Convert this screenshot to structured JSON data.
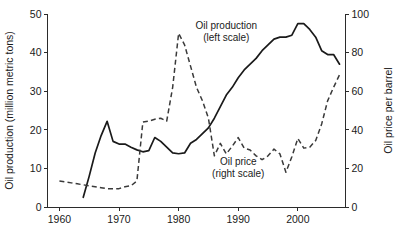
{
  "chart_data": {
    "type": "line",
    "title": "",
    "xlabel": "",
    "xlim": [
      1958,
      2008
    ],
    "grid": false,
    "legend_position": "inline-annotations",
    "x_ticks": [
      1960,
      1970,
      1980,
      1990,
      2000
    ],
    "x_tick_labels": [
      "1960",
      "1970",
      "1980",
      "1990",
      "2000"
    ],
    "axes": [
      {
        "id": "left",
        "label": "Oil production (million metric tons)",
        "ylim": [
          0,
          50
        ],
        "ticks": [
          0,
          10,
          20,
          30,
          40,
          50
        ],
        "tick_labels": [
          "0",
          "10",
          "20",
          "30",
          "40",
          "50"
        ]
      },
      {
        "id": "right",
        "label": "Oil price per barrel",
        "ylim": [
          0,
          100
        ],
        "ticks": [
          0,
          20,
          40,
          60,
          80,
          100
        ],
        "tick_labels": [
          "0",
          "20",
          "40",
          "60",
          "80",
          "100"
        ]
      }
    ],
    "series": [
      {
        "name": "Oil production",
        "annotation": "Oil production\n(left scale)",
        "annotation_line1": "Oil production",
        "annotation_line2": "(left scale)",
        "axis": "left",
        "style": "solid",
        "color": "#1a1a1a",
        "unit": "million metric tons",
        "x": [
          1964,
          1965,
          1966,
          1967,
          1968,
          1969,
          1970,
          1971,
          1972,
          1973,
          1974,
          1975,
          1976,
          1977,
          1978,
          1979,
          1980,
          1981,
          1982,
          1983,
          1984,
          1985,
          1986,
          1987,
          1988,
          1989,
          1990,
          1991,
          1992,
          1993,
          1994,
          1995,
          1996,
          1997,
          1998,
          1999,
          2000,
          2001,
          2002,
          2003,
          2004,
          2005,
          2006,
          2007
        ],
        "y": [
          2.5,
          8.0,
          14.0,
          18.5,
          22.2,
          17.0,
          16.3,
          16.3,
          15.5,
          14.8,
          14.3,
          14.6,
          18.0,
          17.0,
          15.5,
          14.0,
          13.8,
          14.0,
          16.5,
          17.5,
          19.0,
          20.5,
          23.0,
          26.0,
          29.0,
          31.0,
          33.5,
          35.5,
          37.0,
          38.5,
          40.5,
          42.0,
          43.5,
          44.0,
          44.0,
          44.5,
          47.5,
          47.5,
          46.0,
          44.0,
          40.5,
          39.5,
          39.5,
          37.0
        ]
      },
      {
        "name": "Oil price",
        "annotation": "Oil price\n(right scale)",
        "annotation_line1": "Oil price",
        "annotation_line2": "(right scale)",
        "axis": "right",
        "style": "dashed",
        "color": "#3a3a3a",
        "unit": "price per barrel",
        "x": [
          1960,
          1961,
          1962,
          1963,
          1964,
          1965,
          1966,
          1967,
          1968,
          1969,
          1970,
          1971,
          1972,
          1973,
          1974,
          1975,
          1976,
          1977,
          1978,
          1979,
          1980,
          1981,
          1982,
          1983,
          1984,
          1985,
          1986,
          1987,
          1988,
          1989,
          1990,
          1991,
          1992,
          1993,
          1994,
          1995,
          1996,
          1997,
          1998,
          1999,
          2000,
          2001,
          2002,
          2003,
          2004,
          2005,
          2006,
          2007
        ],
        "y": [
          13.5,
          13.0,
          12.5,
          12.0,
          11.5,
          11.0,
          10.5,
          10.0,
          9.5,
          9.5,
          9.5,
          10.5,
          11.0,
          13.5,
          44.0,
          44.5,
          45.5,
          46.0,
          44.5,
          62.0,
          90.0,
          84.0,
          73.0,
          62.0,
          55.0,
          46.0,
          26.5,
          33.0,
          27.5,
          31.5,
          36.0,
          30.5,
          29.5,
          26.5,
          24.5,
          26.5,
          30.0,
          27.5,
          18.0,
          26.0,
          35.5,
          30.5,
          31.0,
          34.5,
          43.0,
          55.0,
          62.0,
          68.5
        ]
      }
    ],
    "annotations": [
      {
        "text": "Oil production",
        "sub": "(left scale)",
        "x": 1988,
        "y": 46
      },
      {
        "text": "Oil price",
        "sub": "(right scale)",
        "x": 1990,
        "y": 11
      }
    ]
  }
}
